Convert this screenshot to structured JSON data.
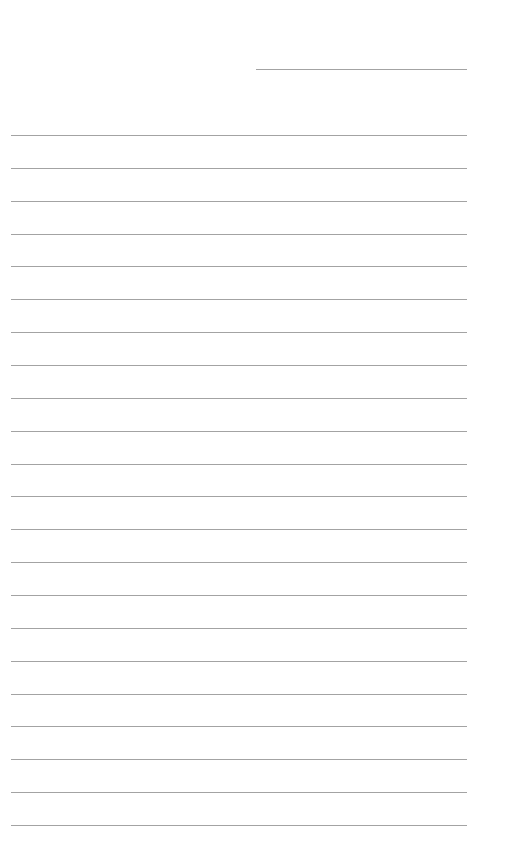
{
  "page": {
    "type": "lined-paper",
    "background": "#ffffff",
    "line_color": "#a3a3a3",
    "header_line": {
      "x": 256,
      "y": 69,
      "width": 211,
      "label": ""
    },
    "ruled_lines": {
      "count": 22,
      "start_y": 135,
      "spacing": 32.86,
      "left": 11,
      "width": 456
    }
  }
}
